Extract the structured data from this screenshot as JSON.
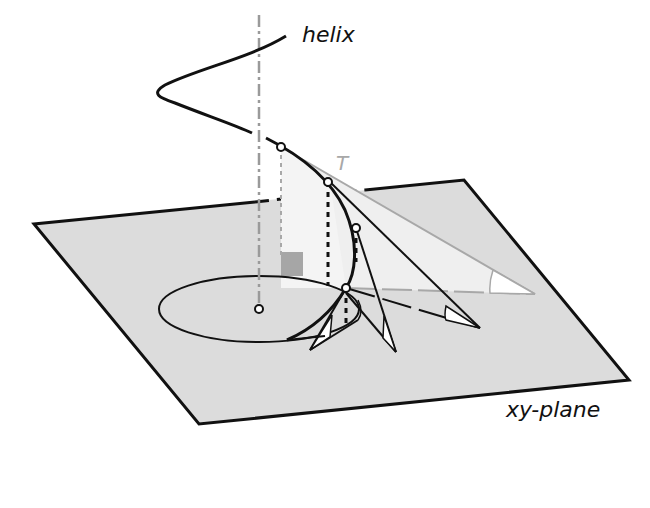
{
  "figure": {
    "labels": {
      "helix": "helix",
      "tangent": "T",
      "plane": "xy-plane"
    },
    "colors": {
      "plane_fill": "#dcdcdc",
      "plane_edge": "#111111",
      "curve": "#111111",
      "axis": "#9a9a9a",
      "tangent_light": "#a8a8a8",
      "projection_fill": "#f2f2f2",
      "angle_fill": "#ffffff",
      "right_angle_marker": "#a6a6a6"
    }
  }
}
